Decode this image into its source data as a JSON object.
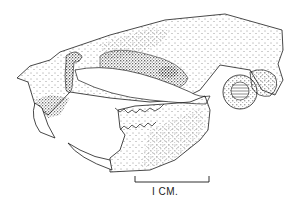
{
  "figure": {
    "style": "stipple ink illustration",
    "ink_color": "#1a1a1a",
    "background_color": "#ffffff"
  },
  "scale_bar": {
    "label": "I CM.",
    "length_units": "1 cm"
  },
  "annotations": {
    "hatched_structure": "auditory bulla (horizontal line hatching)"
  }
}
